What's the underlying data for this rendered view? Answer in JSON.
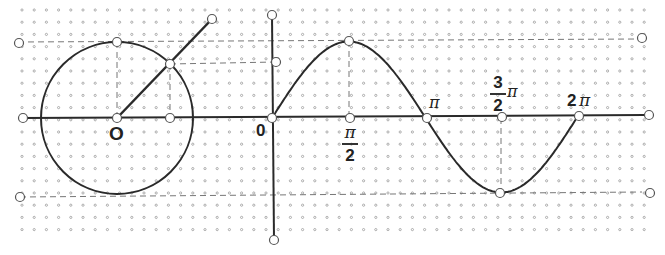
{
  "diagram": {
    "colors": {
      "line": "#2a2a2a",
      "dash": "#777777",
      "grid_dot": "#9a9a9a",
      "point_fill": "#ffffff"
    },
    "grid": {
      "x0": 22,
      "y0": 10,
      "spacing": 12.2,
      "cols": 52,
      "rows": 19
    },
    "unit_circle": {
      "cx": 117,
      "cy": 118,
      "r": 76,
      "origin_label": "O"
    },
    "radius_ray": {
      "from": [
        117,
        118
      ],
      "through": [
        170,
        64
      ],
      "to": [
        212,
        19
      ]
    },
    "axes": {
      "x_axis": {
        "y": 118,
        "x1": 22,
        "x2": 645
      },
      "y_axis": {
        "x": 272,
        "y1": 15,
        "y2": 240
      },
      "origin_label": "0"
    },
    "sine_curve": {
      "x0": 272,
      "x_2pi": 578,
      "amplitude": 76,
      "baseline": 118
    },
    "dashed_lines": [
      {
        "name": "max-level",
        "x1": 18,
        "y1": 42,
        "x2": 640,
        "y2": 39
      },
      {
        "name": "min-level",
        "x1": 20,
        "y1": 197,
        "x2": 642,
        "y2": 192
      },
      {
        "name": "point-level",
        "x1": 170,
        "y1": 64,
        "x2": 276,
        "y2": 62
      },
      {
        "name": "circle-top-drop",
        "x1": 117,
        "y1": 42,
        "x2": 117,
        "y2": 118
      },
      {
        "name": "point-drop",
        "x1": 170,
        "y1": 64,
        "x2": 170,
        "y2": 118
      },
      {
        "name": "peak-drop",
        "x1": 349,
        "y1": 41,
        "x2": 349,
        "y2": 118
      },
      {
        "name": "trough-drop",
        "x1": 501,
        "y1": 118,
        "x2": 501,
        "y2": 193
      }
    ],
    "labels": {
      "circle_origin": "O",
      "graph_origin": "0",
      "half_pi_num": "π",
      "half_pi_den": "2",
      "pi": "π",
      "three_half_num": "3",
      "three_half_den": "2",
      "three_half_pi": "π",
      "two_pi_coef": "2",
      "two_pi_sym": "π"
    },
    "points": [
      {
        "name": "left-top-handle",
        "x": 19,
        "y": 43
      },
      {
        "name": "left-axis-handle",
        "x": 23,
        "y": 118
      },
      {
        "name": "left-bottom-handle",
        "x": 20,
        "y": 197
      },
      {
        "name": "circle-top",
        "x": 117,
        "y": 42
      },
      {
        "name": "circle-center",
        "x": 117,
        "y": 118
      },
      {
        "name": "circle-point",
        "x": 170,
        "y": 64
      },
      {
        "name": "projection-x",
        "x": 170,
        "y": 118
      },
      {
        "name": "ray-end",
        "x": 212,
        "y": 19
      },
      {
        "name": "y-axis-top",
        "x": 272,
        "y": 15
      },
      {
        "name": "y-axis-projection",
        "x": 276,
        "y": 62
      },
      {
        "name": "graph-origin",
        "x": 272,
        "y": 118
      },
      {
        "name": "y-axis-bottom",
        "x": 274,
        "y": 240
      },
      {
        "name": "sine-peak",
        "x": 349,
        "y": 41
      },
      {
        "name": "half-pi-point",
        "x": 350,
        "y": 118
      },
      {
        "name": "pi-point",
        "x": 427,
        "y": 118
      },
      {
        "name": "three-half-pi-point",
        "x": 502,
        "y": 117
      },
      {
        "name": "sine-trough",
        "x": 500,
        "y": 193
      },
      {
        "name": "two-pi-point",
        "x": 579,
        "y": 116
      },
      {
        "name": "right-top-handle",
        "x": 642,
        "y": 38
      },
      {
        "name": "right-axis-handle",
        "x": 649,
        "y": 115
      },
      {
        "name": "right-bottom-handle",
        "x": 650,
        "y": 193
      }
    ]
  }
}
